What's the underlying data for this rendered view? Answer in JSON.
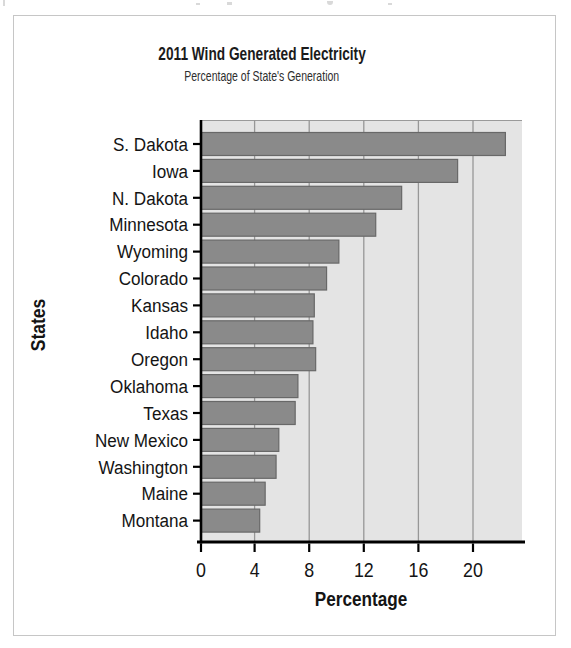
{
  "chart": {
    "title": "2011 Wind Generated Electricity",
    "subtitle": "Percentage of State's Generation"
  },
  "chart_data": {
    "type": "bar",
    "orientation": "horizontal",
    "title": "2011 Wind Generated Electricity",
    "subtitle": "Percentage of State's Generation",
    "xlabel": "Percentage",
    "ylabel": "States",
    "categories": [
      "S. Dakota",
      "Iowa",
      "N. Dakota",
      "Minnesota",
      "Wyoming",
      "Colorado",
      "Kansas",
      "Idaho",
      "Oregon",
      "Oklahoma",
      "Texas",
      "New Mexico",
      "Washington",
      "Maine",
      "Montana"
    ],
    "values": [
      22.3,
      18.8,
      14.7,
      12.8,
      10.1,
      9.2,
      8.3,
      8.2,
      8.4,
      7.1,
      6.9,
      5.7,
      5.5,
      4.7,
      4.3
    ],
    "x_ticks": [
      0,
      4,
      8,
      12,
      16,
      20
    ],
    "xlim": [
      0,
      23.6
    ],
    "grid": true,
    "grid_direction": "vertical",
    "legend": false,
    "colors": {
      "bar_fill": "#8a8a8a",
      "bar_stroke": "#686868",
      "plot_bg": "#e4e4e4",
      "gridline": "#979797",
      "axis": "#000000",
      "text": "#141414",
      "panel_top_edge": "#9a9a9a",
      "card_border": "#c6c6c6"
    }
  }
}
